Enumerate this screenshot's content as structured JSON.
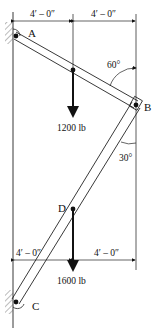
{
  "diagram": {
    "points": {
      "A": "A",
      "B": "B",
      "C": "C",
      "D": "D"
    },
    "dimensions": {
      "top_left": "4′ – 0″",
      "top_right": "4′ – 0″",
      "bottom_left": "4′ – 0″",
      "bottom_right": "4′ – 0″"
    },
    "angles": {
      "upper_at_B": "60°",
      "lower_at_B": "30°"
    },
    "loads": [
      {
        "label": "1200 lb",
        "member": "AB",
        "location": "midpoint"
      },
      {
        "label": "1600 lb",
        "member": "CB",
        "location": "D"
      }
    ],
    "supports": {
      "A": "pin to wall",
      "C": "pin to wall"
    }
  }
}
